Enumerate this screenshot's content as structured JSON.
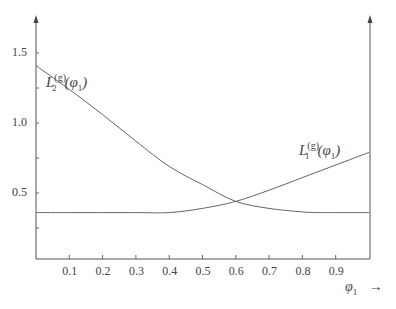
{
  "chart_data": {
    "type": "line",
    "title": "",
    "xlabel": "φ1 →",
    "ylabel": "",
    "xlim": [
      0,
      1
    ],
    "ylim": [
      0.0,
      1.7
    ],
    "x_ticks": [
      "0.1",
      "0.2",
      "0.3",
      "0.4",
      "0.5",
      "0.6",
      "0.7",
      "0.8",
      "0.9"
    ],
    "y_ticks": [
      "0.5",
      "1.0",
      "1.5"
    ],
    "grid": false,
    "series": [
      {
        "name": "L2^(g)(φ1)",
        "x": [
          0.0,
          0.1,
          0.2,
          0.3,
          0.4,
          0.5,
          0.6,
          0.7,
          0.8,
          0.85,
          0.9,
          1.0
        ],
        "y": [
          1.41,
          1.24,
          1.06,
          0.87,
          0.69,
          0.56,
          0.44,
          0.39,
          0.365,
          0.36,
          0.36,
          0.36
        ]
      },
      {
        "name": "L1^(g)(φ1)",
        "x": [
          0.0,
          0.1,
          0.2,
          0.3,
          0.4,
          0.5,
          0.6,
          0.7,
          0.8,
          0.9,
          1.0
        ],
        "y": [
          0.36,
          0.36,
          0.36,
          0.36,
          0.36,
          0.39,
          0.44,
          0.52,
          0.61,
          0.7,
          0.79
        ]
      }
    ],
    "annotations": [
      {
        "text": "L2^(g)(φ1)",
        "near": "left end of L2 curve"
      },
      {
        "text": "L1^(g)(φ1)",
        "near": "right end of L1 curve"
      }
    ]
  },
  "labels": {
    "y": [
      "1.5",
      "1.0",
      "0.5"
    ],
    "x": [
      "0.1",
      "0.2",
      "0.3",
      "0.4",
      "0.5",
      "0.6",
      "0.7",
      "0.8",
      "0.9"
    ],
    "xaxis_symbol": "φ",
    "xaxis_sub": "1",
    "xaxis_arrow": "→",
    "l2": {
      "main": "L",
      "sup": "(g)",
      "sub": "2",
      "arg": "(φ",
      "argsub": "1",
      "close": ")"
    },
    "l1": {
      "main": "L",
      "sup": "(g)",
      "sub": "1",
      "arg": "(φ",
      "argsub": "1",
      "close": ")"
    }
  }
}
